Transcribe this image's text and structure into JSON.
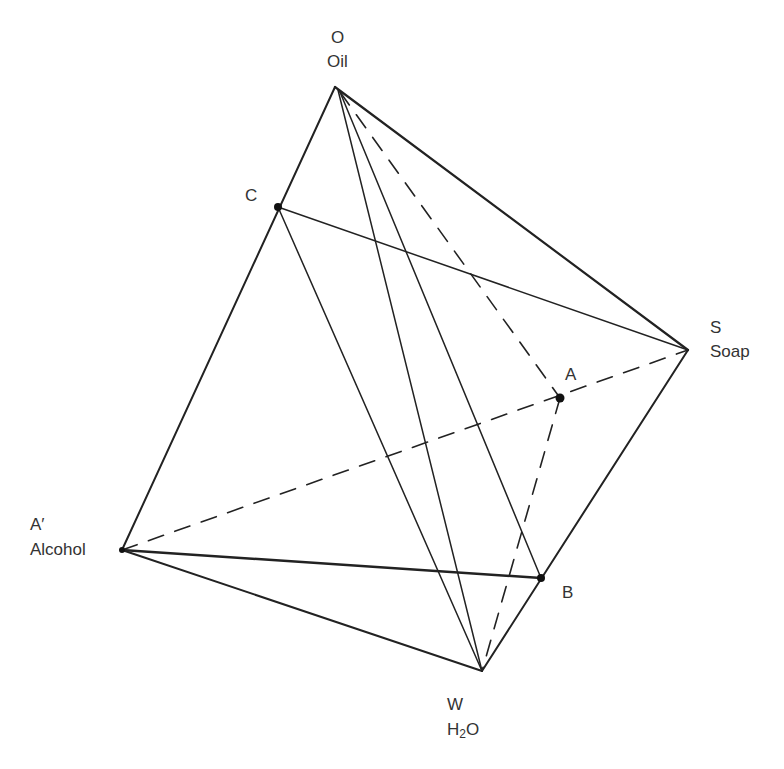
{
  "diagram": {
    "type": "tetrahedron-phase-diagram",
    "vertices": {
      "O": {
        "letter": "O",
        "name": "Oil",
        "x": 335,
        "y": 87
      },
      "S": {
        "letter": "S",
        "name": "Soap",
        "x": 688,
        "y": 350
      },
      "A_prime": {
        "letter": "A′",
        "name": "Alcohol",
        "x": 122,
        "y": 550
      },
      "W": {
        "letter": "W",
        "name_prefix": "H",
        "name_sub": "2",
        "name_suffix": "O",
        "x": 482,
        "y": 671
      }
    },
    "points": {
      "C": {
        "label": "C",
        "x": 278,
        "y": 207
      },
      "A": {
        "label": "A",
        "x": 560,
        "y": 398
      },
      "B": {
        "label": "B",
        "x": 541,
        "y": 578
      }
    },
    "edges_solid": [
      "O-A'",
      "O-S",
      "S-W",
      "A'-W",
      "A'-B",
      "C-S",
      "C-W",
      "O-W",
      "O-B"
    ],
    "edges_dashed": [
      "A'-S",
      "O-A",
      "A-W"
    ],
    "line_color": "#222222"
  }
}
